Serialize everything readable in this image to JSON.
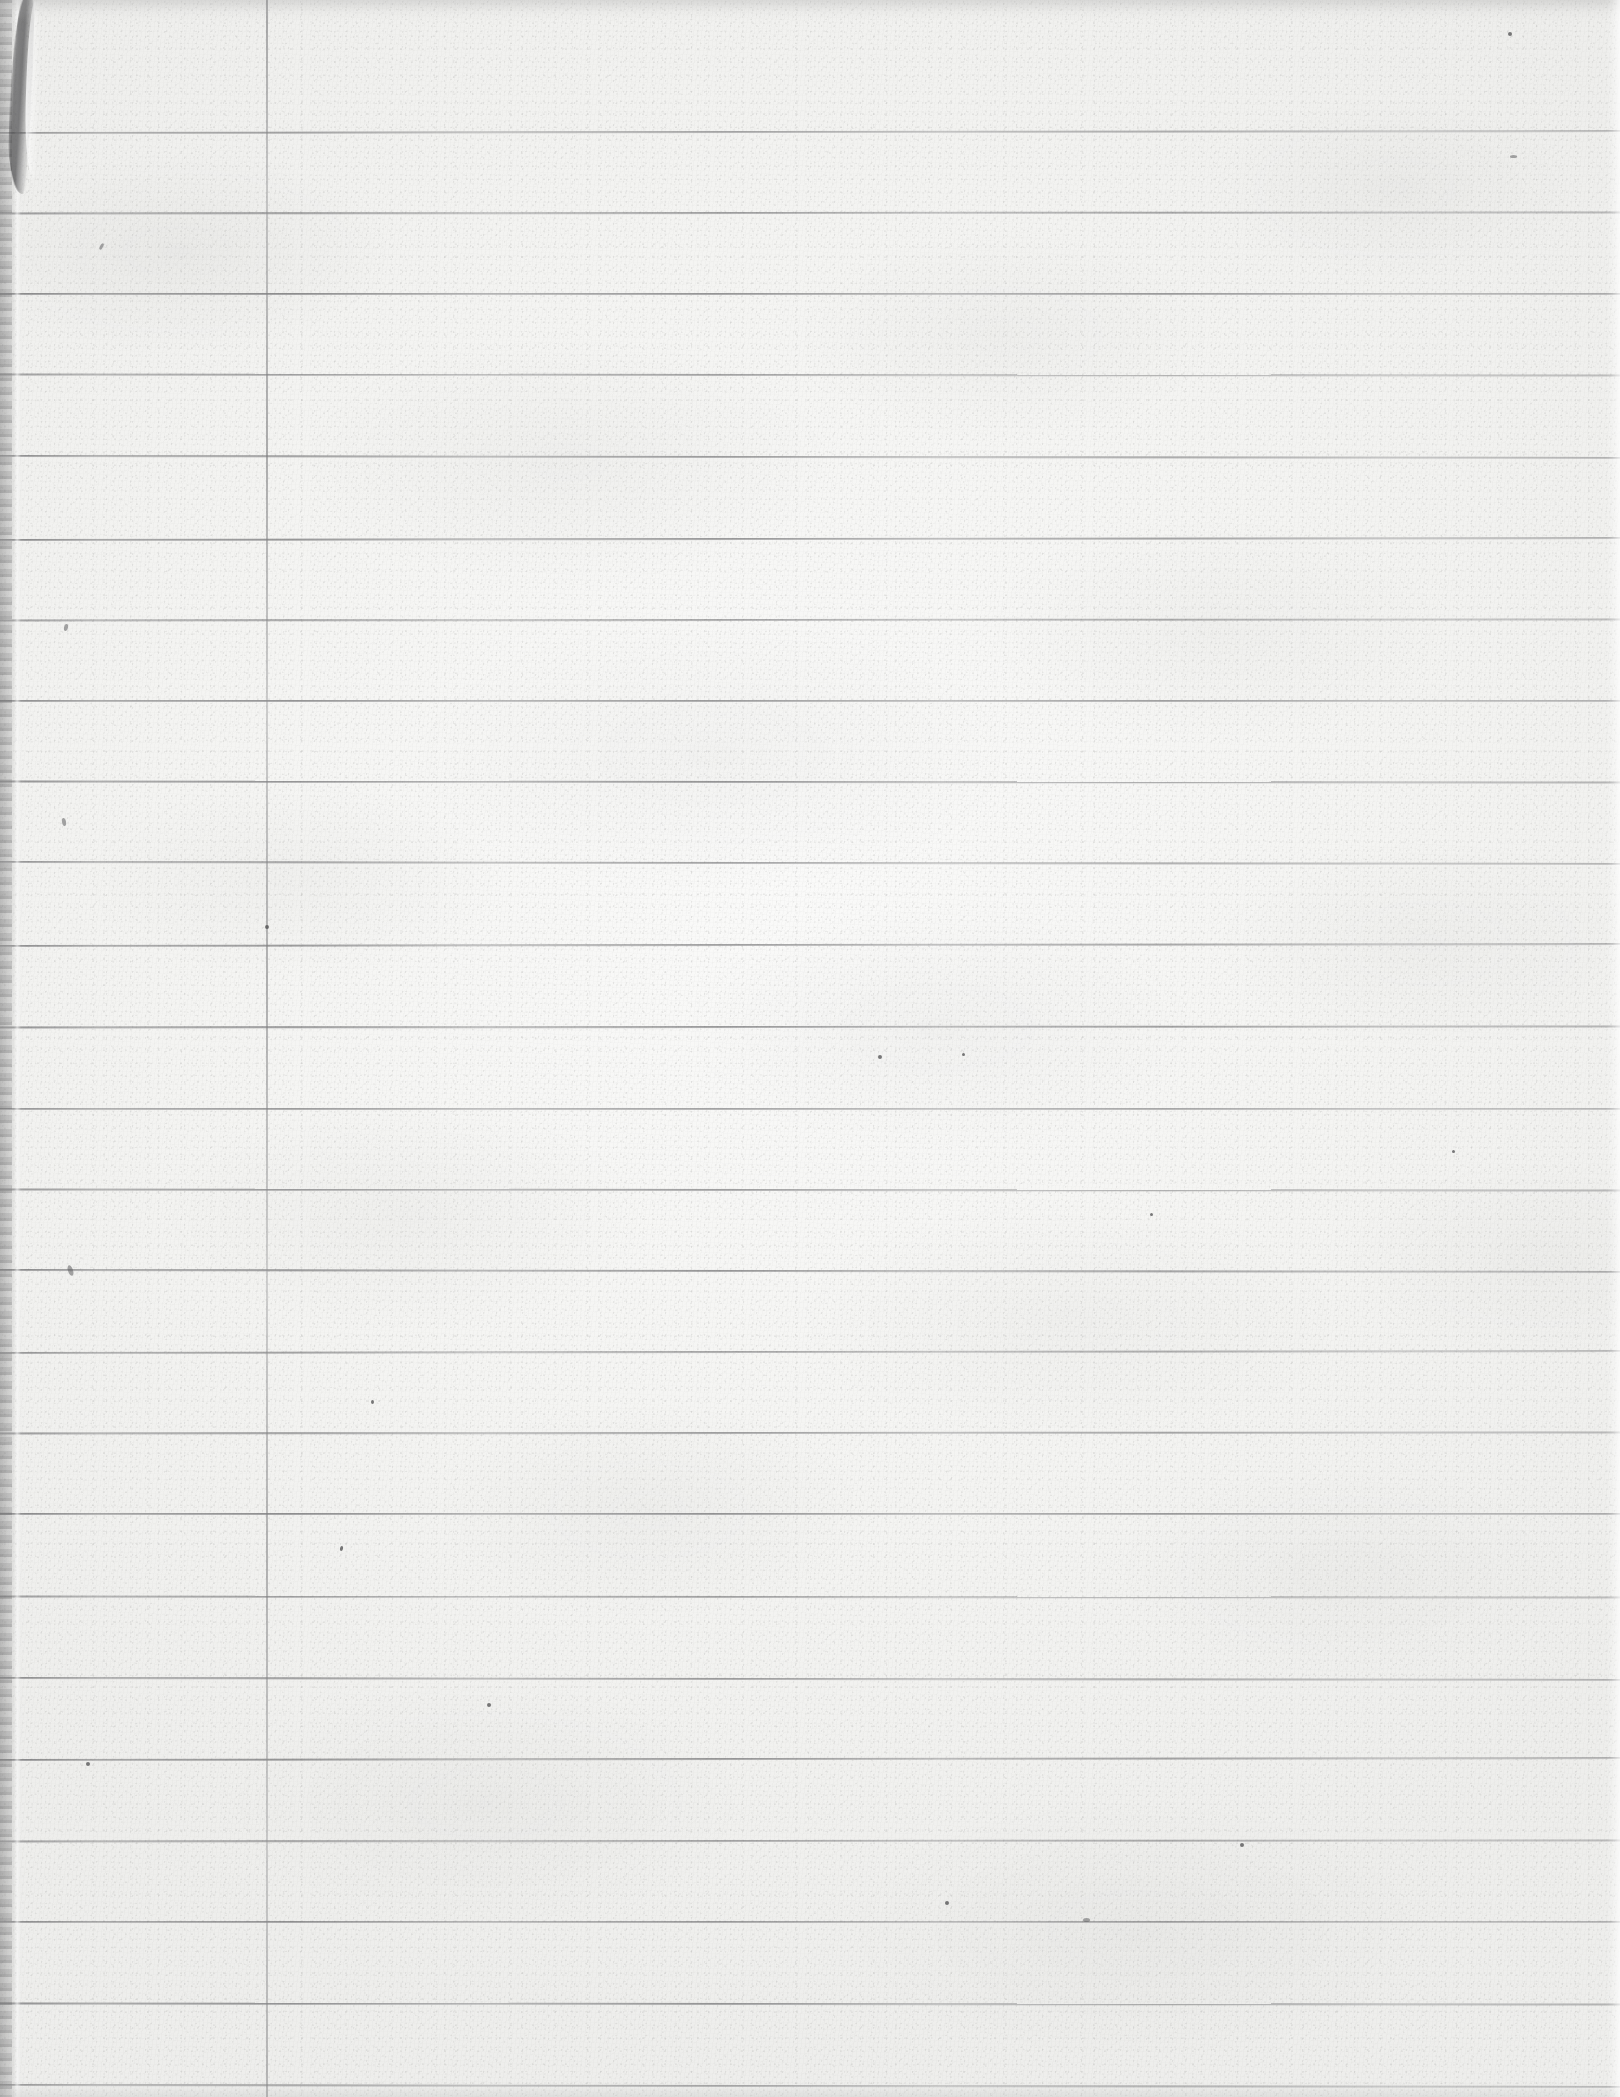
{
  "document": {
    "title": "Scanned Blank Lined Notebook Paper",
    "kind": "scanned-ruled-paper",
    "page_width": 1620,
    "page_height": 2097,
    "content_text": "",
    "is_blank": true
  },
  "paper": {
    "base_color": "#f4f4f2",
    "highlight_color": "#fafaf9",
    "shadow_color": "#eeeeec",
    "texture": "speckled-fiber-grain"
  },
  "ruling": {
    "style": "college-ruled",
    "line_color": "#5e5e60",
    "line_count": 25,
    "line_spacing_px": 81.5,
    "first_line_y": 131,
    "last_line_y": 2085,
    "line_left_x": 0,
    "line_right_x": 1620,
    "line_y_positions": [
      131,
      212,
      293,
      374,
      456,
      538,
      619,
      700,
      781,
      862,
      944,
      1026,
      1108,
      1189,
      1270,
      1351,
      1432,
      1513,
      1596,
      1678,
      1758,
      1840,
      1921,
      2003,
      2085
    ]
  },
  "margin_rule": {
    "orientation": "vertical",
    "color": "#787a7c",
    "x_position": 266,
    "width_px": 2,
    "spans_full_height": true
  },
  "page_edge": {
    "side": "left",
    "gutter_width_px": 26,
    "shadow_color": "#969696",
    "crease_x": 14,
    "has_torn_corner": true,
    "torn_corner_position": "top-left",
    "torn_corner_height_px": 198
  },
  "artifacts": {
    "scan_band_top": true,
    "scan_band_bottom": true,
    "right_edge_highlight": true,
    "specks": [
      {
        "x": 68,
        "y": 1265,
        "w": 5,
        "h": 11,
        "rot": -18
      },
      {
        "x": 62,
        "y": 818,
        "w": 4,
        "h": 8,
        "rot": -12
      },
      {
        "x": 64,
        "y": 624,
        "w": 4,
        "h": 7,
        "rot": 10
      },
      {
        "x": 100,
        "y": 243,
        "w": 3,
        "h": 7,
        "rot": 28
      },
      {
        "x": 86,
        "y": 1762,
        "w": 4,
        "h": 4,
        "rot": 0
      },
      {
        "x": 265,
        "y": 925,
        "w": 4,
        "h": 4,
        "rot": 0
      },
      {
        "x": 340,
        "y": 1546,
        "w": 3,
        "h": 5,
        "rot": 15
      },
      {
        "x": 371,
        "y": 1400,
        "w": 3,
        "h": 4,
        "rot": 0
      },
      {
        "x": 487,
        "y": 1703,
        "w": 4,
        "h": 4,
        "rot": 0
      },
      {
        "x": 878,
        "y": 1055,
        "w": 4,
        "h": 4,
        "rot": 0
      },
      {
        "x": 962,
        "y": 1053,
        "w": 3,
        "h": 3,
        "rot": 0
      },
      {
        "x": 1150,
        "y": 1213,
        "w": 3,
        "h": 3,
        "rot": 0
      },
      {
        "x": 1240,
        "y": 1843,
        "w": 4,
        "h": 4,
        "rot": 0
      },
      {
        "x": 1452,
        "y": 1150,
        "w": 3,
        "h": 3,
        "rot": 0
      },
      {
        "x": 1510,
        "y": 155,
        "w": 7,
        "h": 3,
        "rot": 0
      },
      {
        "x": 1508,
        "y": 32,
        "w": 4,
        "h": 4,
        "rot": 0
      },
      {
        "x": 945,
        "y": 1901,
        "w": 4,
        "h": 4,
        "rot": 0
      },
      {
        "x": 1083,
        "y": 1918,
        "w": 7,
        "h": 4,
        "rot": 0
      }
    ]
  }
}
